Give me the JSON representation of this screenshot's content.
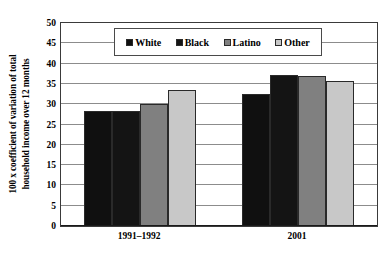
{
  "chart_data": {
    "type": "bar",
    "title": "",
    "subtitle": "",
    "xlabel": "",
    "ylabel": "100 x coefficient of variation of total household  income over 12 months",
    "ylabel_line1": "100 x coefficient of variation of total",
    "ylabel_line2": "household  income over 12 months",
    "categories": [
      "1991–1992",
      "2001"
    ],
    "series": [
      {
        "name": "White",
        "values": [
          28.3,
          32.6
        ],
        "color": "#101010"
      },
      {
        "name": "Black",
        "values": [
          28.3,
          37.3
        ],
        "color": "#141414"
      },
      {
        "name": "Latino",
        "values": [
          30.1,
          37.0
        ],
        "color": "#808080"
      },
      {
        "name": "Other",
        "values": [
          33.5,
          35.7
        ],
        "color": "#c8c8c8"
      }
    ],
    "ylim": [
      0,
      50
    ],
    "yticks": [
      0,
      5,
      10,
      15,
      20,
      25,
      30,
      35,
      40,
      45,
      50
    ],
    "ytick_labels": [
      "0",
      "5",
      "10",
      "15",
      "20",
      "25",
      "30",
      "35",
      "40",
      "45",
      "50"
    ],
    "grid": true,
    "grid_color": "#8c8c8c",
    "legend_position": "top-center",
    "legend_entries": [
      "White",
      "Black",
      "Latino",
      "Other"
    ],
    "plot_background": "#ffffff",
    "axis_color": "#3a3a3a"
  }
}
